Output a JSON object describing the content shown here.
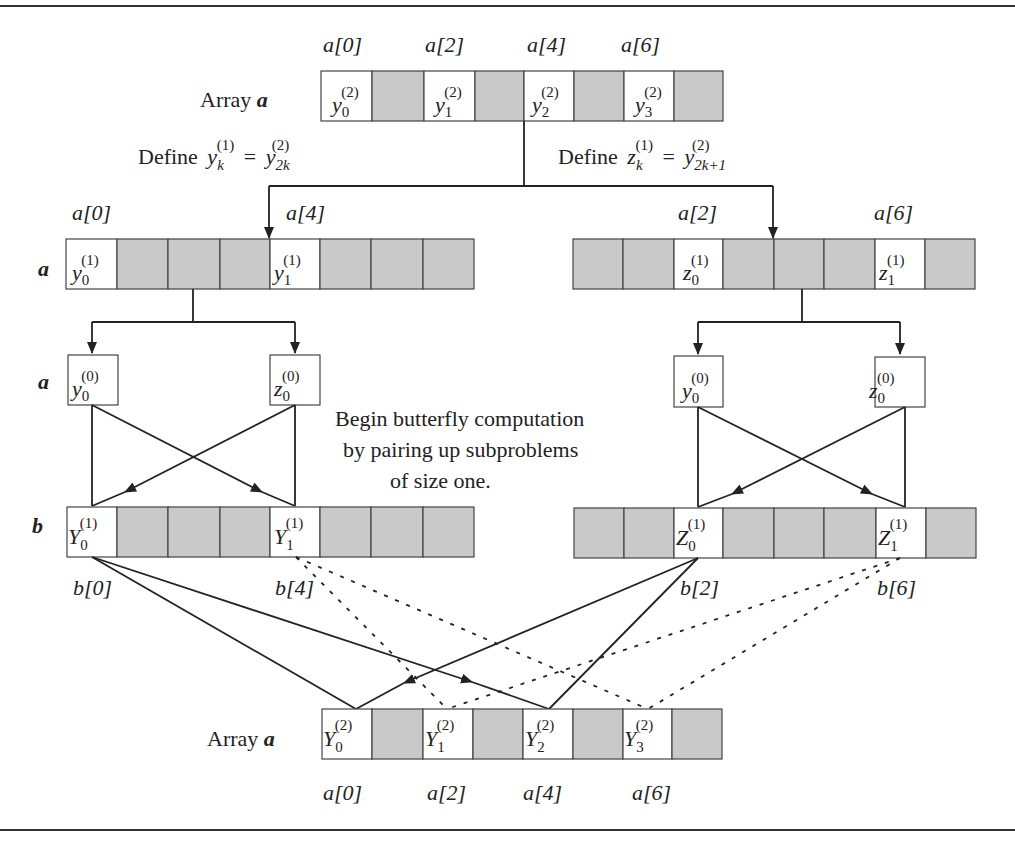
{
  "figure": {
    "fill_colors": {
      "empty_cell": "#c9c9c9",
      "filled_cell": "#ffffff",
      "stroke": "#222222"
    },
    "top_array": {
      "row_label": "Array",
      "array_name": "a",
      "index_labels": [
        "a[0]",
        "a[2]",
        "a[4]",
        "a[6]"
      ],
      "cells": [
        {
          "base": "y",
          "sub": "0",
          "sup": "(2)"
        },
        {
          "base": "y",
          "sub": "1",
          "sup": "(2)"
        },
        {
          "base": "y",
          "sub": "2",
          "sup": "(2)"
        },
        {
          "base": "y",
          "sub": "3",
          "sup": "(2)"
        }
      ]
    },
    "split_labels": {
      "left": {
        "prefix": "Define",
        "lhs": "y",
        "lhs_sub": "k",
        "lhs_sup": "(1)",
        "eq": "=",
        "rhs": "y",
        "rhs_sub": "2k",
        "rhs_sup": "(2)"
      },
      "right": {
        "prefix": "Define",
        "lhs": "z",
        "lhs_sub": "k",
        "lhs_sup": "(1)",
        "eq": "=",
        "rhs": "y",
        "rhs_sub": "2k+1",
        "rhs_sup": "(2)"
      }
    },
    "level1": {
      "array_name": "a",
      "left": {
        "index_labels": [
          "a[0]",
          "a[4]"
        ],
        "cells": [
          {
            "base": "y",
            "sub": "0",
            "sup": "(1)"
          },
          {
            "base": "y",
            "sub": "1",
            "sup": "(1)"
          }
        ]
      },
      "right": {
        "index_labels": [
          "a[2]",
          "a[6]"
        ],
        "cells": [
          {
            "base": "z",
            "sub": "0",
            "sup": "(1)"
          },
          {
            "base": "z",
            "sub": "1",
            "sup": "(1)"
          }
        ]
      }
    },
    "level0": {
      "array_name": "a",
      "left": [
        {
          "base": "y",
          "sub": "0",
          "sup": "(0)"
        },
        {
          "base": "z",
          "sub": "0",
          "sup": "(0)"
        }
      ],
      "right": [
        {
          "base": "y",
          "sub": "0",
          "sup": "(0)"
        },
        {
          "base": "z",
          "sub": "0",
          "sup": "(0)"
        }
      ]
    },
    "annotation": {
      "lines": [
        "Begin butterfly computation",
        "by pairing up subproblems",
        "of size one."
      ]
    },
    "b_array": {
      "array_name": "b",
      "left": {
        "index_labels": [
          "b[0]",
          "b[4]"
        ],
        "cells": [
          {
            "base": "Y",
            "sub": "0",
            "sup": "(1)"
          },
          {
            "base": "Y",
            "sub": "1",
            "sup": "(1)"
          }
        ]
      },
      "right": {
        "index_labels": [
          "b[2]",
          "b[6]"
        ],
        "cells": [
          {
            "base": "Z",
            "sub": "0",
            "sup": "(1)"
          },
          {
            "base": "Z",
            "sub": "1",
            "sup": "(1)"
          }
        ]
      }
    },
    "bottom_array": {
      "row_label": "Array",
      "array_name": "a",
      "index_labels": [
        "a[0]",
        "a[2]",
        "a[4]",
        "a[6]"
      ],
      "cells": [
        {
          "base": "Y",
          "sub": "0",
          "sup": "(2)"
        },
        {
          "base": "Y",
          "sub": "1",
          "sup": "(2)"
        },
        {
          "base": "Y",
          "sub": "2",
          "sup": "(2)"
        },
        {
          "base": "Y",
          "sub": "3",
          "sup": "(2)"
        }
      ]
    }
  }
}
